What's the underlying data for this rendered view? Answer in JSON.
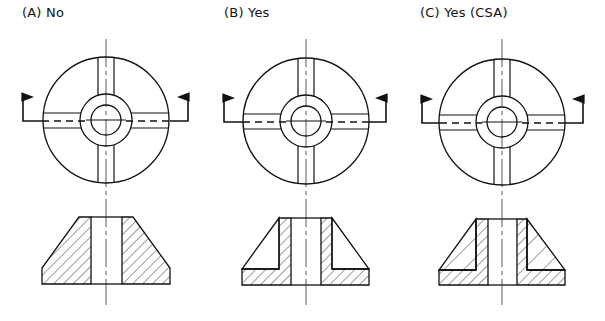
{
  "figure": {
    "panels": [
      {
        "id": "A",
        "label": "(A) No",
        "section_style": "full-hatch",
        "center_x": 106
      },
      {
        "id": "B",
        "label": "(B) Yes",
        "section_style": "ribs-unhatched",
        "center_x": 306
      },
      {
        "id": "C",
        "label": "(C) Yes (CSA)",
        "section_style": "ribs-alternate-hatch",
        "center_x": 502
      }
    ],
    "colors": {
      "line": "#111111",
      "background": "#ffffff"
    }
  }
}
